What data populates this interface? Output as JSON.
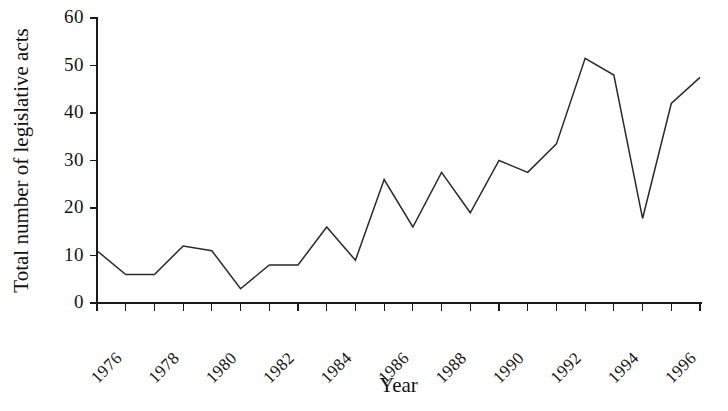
{
  "chart_data": {
    "type": "line",
    "title": "",
    "xlabel": "Year",
    "ylabel": "Total number of legislative acts",
    "x": [
      1976,
      1977,
      1978,
      1979,
      1980,
      1981,
      1982,
      1983,
      1984,
      1985,
      1986,
      1987,
      1988,
      1989,
      1990,
      1991,
      1992,
      1993,
      1994,
      1995,
      1996,
      1997
    ],
    "values": [
      11,
      6,
      6,
      12,
      11,
      3,
      8,
      8,
      16,
      9,
      26,
      16,
      27.5,
      19,
      30,
      27.5,
      33.5,
      51.5,
      48,
      17.8,
      42,
      47.5
    ],
    "series": [
      {
        "name": "Total number of legislative acts",
        "values": [
          11,
          6,
          6,
          12,
          11,
          3,
          8,
          8,
          16,
          9,
          26,
          16,
          27.5,
          19,
          30,
          27.5,
          33.5,
          51.5,
          48,
          17.8,
          42,
          47.5
        ]
      }
    ],
    "xlim": [
      1976,
      1997
    ],
    "ylim": [
      0,
      60
    ],
    "xticks": [
      1976,
      1977,
      1978,
      1979,
      1980,
      1981,
      1982,
      1983,
      1984,
      1985,
      1986,
      1987,
      1988,
      1989,
      1990,
      1991,
      1992,
      1993,
      1994,
      1995,
      1996,
      1997
    ],
    "xtick_labels": [
      "1976",
      "",
      "1978",
      "",
      "1980",
      "",
      "1982",
      "",
      "1984",
      "",
      "1986",
      "",
      "1988",
      "",
      "1990",
      "",
      "1992",
      "",
      "1994",
      "",
      "1996",
      ""
    ],
    "ytick_labels": [
      "0",
      "10",
      "20",
      "30",
      "40",
      "50",
      "60"
    ],
    "yticks": [
      0,
      10,
      20,
      30,
      40,
      50,
      60
    ],
    "grid": false,
    "legend": "none",
    "line_color": "#2a2a2a",
    "axis_color": "#1a1a1a"
  }
}
